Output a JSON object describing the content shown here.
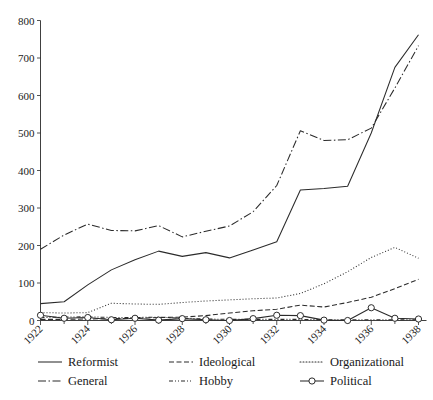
{
  "chart_data": {
    "type": "line",
    "title": "",
    "subtitle": "",
    "xlabel": "",
    "ylabel": "",
    "x": [
      1922,
      1923,
      1924,
      1925,
      1926,
      1927,
      1928,
      1929,
      1930,
      1931,
      1932,
      1933,
      1934,
      1935,
      1936,
      1937,
      1938
    ],
    "xlim": [
      1922,
      1938
    ],
    "ylim": [
      0,
      800
    ],
    "ytick_labels": [
      "0",
      "100",
      "200",
      "300",
      "400",
      "500",
      "600",
      "700",
      "800"
    ],
    "ytick_values": [
      0,
      100,
      200,
      300,
      400,
      500,
      600,
      700,
      800
    ],
    "xtick_labels": [
      "1922",
      "1924",
      "1926",
      "1928",
      "1930",
      "1932",
      "1934",
      "1936",
      "1938"
    ],
    "xtick_values": [
      1922,
      1924,
      1926,
      1928,
      1930,
      1932,
      1934,
      1936,
      1938
    ],
    "xtick_minor_values": [
      1923,
      1925,
      1927,
      1929,
      1931,
      1933,
      1935,
      1937
    ],
    "xtick_rotation": 45,
    "grid": false,
    "legend_position": "below",
    "series": [
      {
        "name": "Reformist",
        "style": "solid",
        "dasharray": "none",
        "marker": "none",
        "color": "#2b2b2b",
        "values": [
          45,
          50,
          95,
          135,
          162,
          185,
          171,
          181,
          167,
          188,
          210,
          348,
          352,
          358,
          500,
          675,
          762
        ]
      },
      {
        "name": "General",
        "style": "dash-dot",
        "dasharray": "8,2.5,1.5,2.5",
        "marker": "none",
        "color": "#2b2b2b",
        "values": [
          190,
          228,
          257,
          240,
          239,
          253,
          223,
          238,
          252,
          290,
          360,
          506,
          480,
          482,
          513,
          620,
          733
        ]
      },
      {
        "name": "Organizational",
        "style": "dotted",
        "dasharray": "1,2",
        "marker": "none",
        "color": "#2b2b2b",
        "values": [
          21,
          20,
          21,
          46,
          44,
          43,
          48,
          52,
          55,
          58,
          60,
          72,
          98,
          130,
          168,
          195,
          166
        ]
      },
      {
        "name": "Ideological",
        "style": "dashed",
        "dasharray": "5,2.5",
        "marker": "none",
        "color": "#2b2b2b",
        "values": [
          3,
          3,
          4,
          5,
          6,
          8,
          9,
          13,
          20,
          26,
          30,
          41,
          36,
          48,
          62,
          85,
          110
        ]
      },
      {
        "name": "Hobby",
        "style": "dash-dot-dot",
        "dasharray": "4,2,1,2,1,2",
        "marker": "none",
        "color": "#2b2b2b",
        "values": [
          8,
          9,
          10,
          8,
          8,
          9,
          6,
          4,
          3,
          3,
          3,
          3,
          2,
          2,
          2,
          2,
          2
        ]
      },
      {
        "name": "Political",
        "style": "solid-marker",
        "dasharray": "none",
        "marker": "circle",
        "color": "#2b2b2b",
        "values": [
          14,
          6,
          8,
          2,
          6,
          1,
          5,
          2,
          0,
          5,
          14,
          13,
          1,
          0,
          34,
          6,
          4
        ]
      }
    ]
  },
  "legend": {
    "entries": [
      {
        "label": "Reformist",
        "style": "solid"
      },
      {
        "label": "Ideological",
        "style": "dashed"
      },
      {
        "label": "Organizational",
        "style": "dotted"
      },
      {
        "label": "General",
        "style": "dash-dot"
      },
      {
        "label": "Hobby",
        "style": "dash-dot-dot"
      },
      {
        "label": "Political",
        "style": "solid-marker"
      }
    ]
  }
}
